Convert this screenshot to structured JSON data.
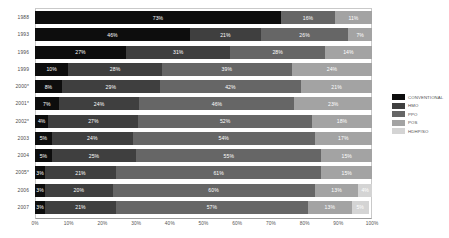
{
  "chart_data": {
    "type": "bar",
    "subtype": "horizontal-stacked-100",
    "title": "",
    "xlabel": "",
    "ylabel": "",
    "xlim": [
      0,
      100
    ],
    "grid": false,
    "legend_position": "right",
    "categories": [
      "1988",
      "1993",
      "1996",
      "1999",
      "2000*",
      "2001*",
      "2002*",
      "2003",
      "2004",
      "2005*",
      "2006",
      "2007"
    ],
    "xticks": [
      "0%",
      "10%",
      "20%",
      "30%",
      "40%",
      "50%",
      "60%",
      "70%",
      "80%",
      "90%",
      "100%"
    ],
    "xtick_values": [
      0,
      10,
      20,
      30,
      40,
      50,
      60,
      70,
      80,
      90,
      100
    ],
    "series": [
      {
        "name": "CONVENTIONAL",
        "color": "#0d0d0d",
        "values": [
          73,
          46,
          27,
          10,
          8,
          7,
          4,
          5,
          5,
          3,
          3,
          3
        ],
        "labels": [
          "73%",
          "46%",
          "27%",
          "10%",
          "8%",
          "7%",
          "4%",
          "5%",
          "5%",
          "3%",
          "3%",
          "3%"
        ]
      },
      {
        "name": "HMO",
        "color": "#3f3f3f",
        "values": [
          0,
          21,
          31,
          28,
          29,
          24,
          27,
          24,
          25,
          21,
          20,
          21
        ],
        "labels": [
          "",
          "21%",
          "31%",
          "28%",
          "29%",
          "24%",
          "27%",
          "24%",
          "25%",
          "21%",
          "20%",
          "21%"
        ]
      },
      {
        "name": "PPO",
        "color": "#666666",
        "values": [
          16,
          26,
          28,
          39,
          42,
          46,
          52,
          54,
          55,
          61,
          60,
          57
        ],
        "labels": [
          "16%",
          "26%",
          "28%",
          "39%",
          "42%",
          "46%",
          "52%",
          "54%",
          "55%",
          "61%",
          "60%",
          "57%"
        ]
      },
      {
        "name": "POS",
        "color": "#a3a3a3",
        "values": [
          11,
          7,
          14,
          24,
          21,
          23,
          18,
          17,
          15,
          15,
          13,
          13
        ],
        "labels": [
          "11%",
          "7%",
          "14%",
          "24%",
          "21%",
          "23%",
          "18%",
          "17%",
          "15%",
          "15%",
          "13%",
          "13%"
        ]
      },
      {
        "name": "HDHP/SO",
        "color": "#d4d4d4",
        "values": [
          0,
          0,
          0,
          0,
          0,
          0,
          0,
          0,
          0,
          0,
          4,
          5
        ],
        "labels": [
          "",
          "",
          "",
          "",
          "",
          "",
          "",
          "",
          "",
          "",
          "4%",
          "5%"
        ]
      }
    ]
  },
  "legend": {
    "items": [
      {
        "label": "CONVENTIONAL",
        "color": "#0d0d0d"
      },
      {
        "label": "HMO",
        "color": "#3f3f3f"
      },
      {
        "label": "PPO",
        "color": "#666666"
      },
      {
        "label": "POS",
        "color": "#a3a3a3"
      },
      {
        "label": "HDHP/SO",
        "color": "#d4d4d4"
      }
    ]
  }
}
